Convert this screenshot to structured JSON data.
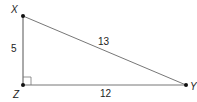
{
  "diagram": {
    "type": "right-triangle",
    "vertices": [
      {
        "name": "X",
        "x": 23,
        "y": 16,
        "label_x": 11,
        "label_y": 13
      },
      {
        "name": "Z",
        "x": 23,
        "y": 85,
        "label_x": 13,
        "label_y": 98
      },
      {
        "name": "Y",
        "x": 186,
        "y": 85,
        "label_x": 190,
        "label_y": 90
      }
    ],
    "sides": [
      {
        "name": "XZ",
        "length": "5",
        "label_x": 15,
        "label_y": 52
      },
      {
        "name": "XY",
        "length": "13",
        "label_x": 104,
        "label_y": 45
      },
      {
        "name": "ZY",
        "length": "12",
        "label_x": 106,
        "label_y": 97
      }
    ],
    "right_angle_at": "Z",
    "line_color": "#555555"
  }
}
